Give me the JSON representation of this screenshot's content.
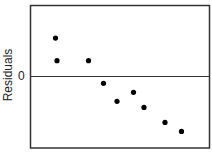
{
  "chart_data": {
    "type": "scatter",
    "title": "",
    "xlabel": "",
    "ylabel": "Residuals",
    "yticks": [
      "0"
    ],
    "grid": false,
    "reference_line": {
      "y": 0,
      "label": "0"
    },
    "xlim": [
      0,
      12
    ],
    "ylim": [
      -4.8,
      4.7
    ],
    "x": [
      1.7,
      1.8,
      3.9,
      4.9,
      5.8,
      6.9,
      7.6,
      9.0,
      10.1
    ],
    "y": [
      2.5,
      1.0,
      1.0,
      -0.5,
      -1.7,
      -1.1,
      -2.1,
      -3.1,
      -3.7
    ],
    "marker_color": "#000000"
  },
  "labels": {
    "ylabel": "Residuals",
    "zero": "0"
  }
}
